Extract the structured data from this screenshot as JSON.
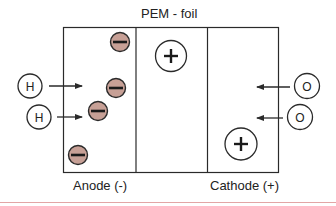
{
  "title": "PEM - foil",
  "regions": [
    {
      "name": "anode",
      "label": "Anode (-)"
    },
    {
      "name": "membrane",
      "label": ""
    },
    {
      "name": "cathode",
      "label": "Cathode (+)"
    }
  ],
  "labels": {
    "title": "PEM - foil",
    "anode": "Anode (-)",
    "cathode": "Cathode (+)"
  },
  "inputs": {
    "hydrogen": [
      {
        "symbol": "H",
        "cx": 30,
        "cy": 86
      },
      {
        "symbol": "H",
        "cx": 39,
        "cy": 117
      }
    ],
    "oxygen": [
      {
        "symbol": "O",
        "cx": 307,
        "cy": 86
      },
      {
        "symbol": "O",
        "cx": 300,
        "cy": 117
      }
    ]
  },
  "charges": {
    "electrons": [
      {
        "sign": "-",
        "cx": 120,
        "cy": 42
      },
      {
        "sign": "-",
        "cx": 116,
        "cy": 88
      },
      {
        "sign": "-",
        "cx": 98,
        "cy": 111
      },
      {
        "sign": "-",
        "cx": 78,
        "cy": 155
      }
    ],
    "protons": [
      {
        "sign": "+",
        "cx": 171,
        "cy": 56
      },
      {
        "sign": "+",
        "cx": 241,
        "cy": 144
      }
    ]
  },
  "colors": {
    "stroke": "#2a2a2a",
    "electron_fill": "#c7a096",
    "separator_line": "#e2a5a5"
  },
  "symbols": {
    "h1": "H",
    "h2": "H",
    "o1": "O",
    "o2": "O"
  }
}
